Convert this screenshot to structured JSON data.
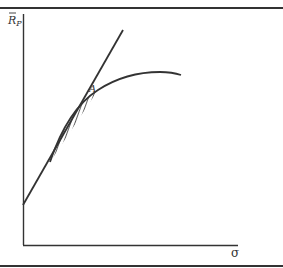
{
  "diagram": {
    "y_axis_label": "R",
    "y_axis_label_subscript": "P",
    "x_axis_label": "σ",
    "point_label": "A",
    "elements": {
      "tangent_line": "straight line from the y-intercept through point A",
      "efficient_frontier": "concave curve meeting the line and passing through A",
      "shaded_region": "hatched area between the line and the curve below A"
    },
    "colors": {
      "ink": "#333333",
      "background": "#ffffff"
    }
  }
}
